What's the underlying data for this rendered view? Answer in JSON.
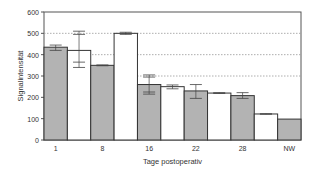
{
  "chart_data": {
    "type": "bar",
    "title": "",
    "xlabel": "Tage postoperativ",
    "ylabel": "Signalintensität",
    "ylim": [
      0,
      600
    ],
    "yticks": [
      0,
      100,
      200,
      300,
      400,
      500,
      600
    ],
    "grid": "dotted horizontal at 300, 400, 500",
    "xtick_labels": [
      "1",
      "8",
      "16",
      "22",
      "28",
      "NW"
    ],
    "bars": [
      {
        "label": "1",
        "value": 435,
        "fill": "grey",
        "err_low": 420,
        "err_high": 445
      },
      {
        "label": "",
        "value": 420,
        "fill": "white",
        "err_low": 340,
        "err_high": 510,
        "err_inner": [
          365,
          495
        ]
      },
      {
        "label": "8",
        "value": 350,
        "fill": "grey",
        "err_low": 348,
        "err_high": 352
      },
      {
        "label": "",
        "value": 500,
        "fill": "white",
        "err_low": 495,
        "err_high": 505
      },
      {
        "label": "16",
        "value": 260,
        "fill": "grey",
        "err_low": 215,
        "err_high": 305,
        "err_inner": [
          225,
          295
        ]
      },
      {
        "label": "",
        "value": 250,
        "fill": "white",
        "err_low": 240,
        "err_high": 258
      },
      {
        "label": "22",
        "value": 230,
        "fill": "grey",
        "err_low": 195,
        "err_high": 260
      },
      {
        "label": "",
        "value": 220,
        "fill": "white",
        "err_low": 218,
        "err_high": 222
      },
      {
        "label": "28",
        "value": 208,
        "fill": "grey",
        "err_low": 195,
        "err_high": 222
      },
      {
        "label": "",
        "value": 122,
        "fill": "white",
        "err_low": 121,
        "err_high": 123
      },
      {
        "label": "NW",
        "value": 98,
        "fill": "grey"
      }
    ],
    "colors": {
      "grey": "#b3b3b3",
      "white": "#ffffff",
      "edge": "#333333"
    }
  }
}
